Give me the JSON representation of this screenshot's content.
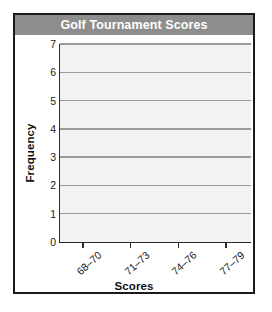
{
  "chart_data": {
    "type": "bar",
    "title": "Golf Tournament Scores",
    "xlabel": "Scores",
    "ylabel": "Frequency",
    "categories": [
      "68–70",
      "71–73",
      "74–76",
      "77–79"
    ],
    "values": [
      0,
      0,
      0,
      0
    ],
    "ylim": [
      0,
      7
    ],
    "yticks": [
      0,
      1,
      2,
      3,
      4,
      5,
      6,
      7
    ],
    "ytick_labels": [
      "0",
      "1",
      "2",
      "3",
      "4",
      "5",
      "6",
      "7"
    ],
    "grid": "horizontal",
    "legend": "none",
    "note": "blank histogram template — axes and gridlines drawn, no bars plotted",
    "colors": {
      "header_bar": "#8d8d8d",
      "header_text": "#ffffff",
      "plot_background": "#f2f2f2",
      "gridline": "#9a9a9a",
      "axis_line": "#2b2b2b",
      "frame_border": "#1a1a1a",
      "bar_fill": "#6e6e6e",
      "page_background": "#ffffff"
    }
  }
}
